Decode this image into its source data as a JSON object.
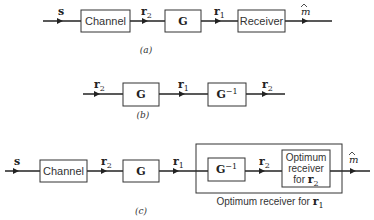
{
  "diagram_a": {
    "caption": "(a)",
    "input_signal": "s",
    "blocks": [
      "Channel",
      "G",
      "Receiver"
    ],
    "signals": [
      "r",
      "r"
    ],
    "signal_subs": [
      "2",
      "1"
    ],
    "output_signal": "m"
  },
  "diagram_b": {
    "caption": "(b)",
    "input_signal": "r",
    "input_sub": "2",
    "blocks": [
      "G",
      "G"
    ],
    "block_sup": "−1",
    "mid_signal": "r",
    "mid_sub": "1",
    "output_signal": "r",
    "output_sub": "2"
  },
  "diagram_c": {
    "caption": "(c)",
    "input_signal": "s",
    "blocks": [
      "Channel",
      "G",
      "G"
    ],
    "block_sup": "−1",
    "signals": [
      "r",
      "r",
      "r"
    ],
    "signal_subs": [
      "2",
      "1",
      "2"
    ],
    "receiver_lines": [
      "Optimum",
      "receiver",
      "for"
    ],
    "receiver_signal": "r",
    "receiver_sub": "2",
    "enclosure_label": "Optimum receiver for",
    "enclosure_signal": "r",
    "enclosure_sub": "1",
    "output_signal": "m"
  }
}
